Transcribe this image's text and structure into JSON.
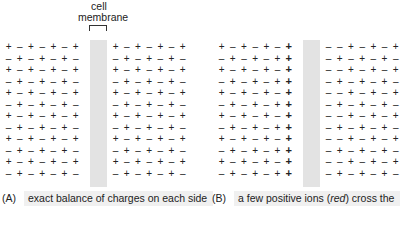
{
  "membrane_label": "cell\nmembrane",
  "membrane_label_line1": "cell",
  "membrane_label_line2": "membrane",
  "colors": {
    "membrane": "#e3e3e3",
    "caption_bg": "#f0f0f0",
    "crossing_ion": "red"
  },
  "panels": [
    {
      "id": "A",
      "caption_tag": "(A)",
      "caption": "exact balance of charges on each side",
      "left_rows": [
        "+-+-+-+",
        "-+-+-+-",
        "+-+-+-+",
        "-+-+-+-",
        "+-+-+-+",
        "-+-+-+-",
        "+-+-+-+",
        "-+-+-+-",
        "+-+-+-+",
        "-+-+-+-",
        "+-+-+-+",
        "-+-+-+-"
      ],
      "right_rows": [
        "+-+-+-+",
        "-+-+-+-",
        "+-+-+-+",
        "-+-+-+-",
        "+-+-+-+",
        "-+-+-+-",
        "+-+-+-+",
        "-+-+-+-",
        "+-+-+-+",
        "-+-+-+-",
        "+-+-+-+",
        "-+-+-+-"
      ],
      "red_cells": []
    },
    {
      "id": "B",
      "caption_tag": "(B)",
      "caption_before": "a few positive ions (",
      "caption_italic": "red",
      "caption_after": ") cross the",
      "left_rows": [
        "+-+-+-+",
        "-+-+-++",
        "+-+-+-+",
        "-+-+-++",
        "+-+-+-+",
        "-+-+-++",
        "+-+-+-+",
        "-+-+-++",
        "+-+-+-+",
        "-+-+-++",
        "+-+-+-+",
        "-+-+-++"
      ],
      "right_rows": [
        "--+-+-+",
        "-+-+-+-",
        "--+-+-+",
        "-+-+-+-",
        "--+-+-+",
        "-+-+-+-",
        "--+-+-+",
        "-+-+-+-",
        "--+-+-+",
        "-+-+-+-",
        "--+-+-+",
        "-+-+-+-"
      ],
      "red_cells": "last column of left grid, every row"
    }
  ]
}
